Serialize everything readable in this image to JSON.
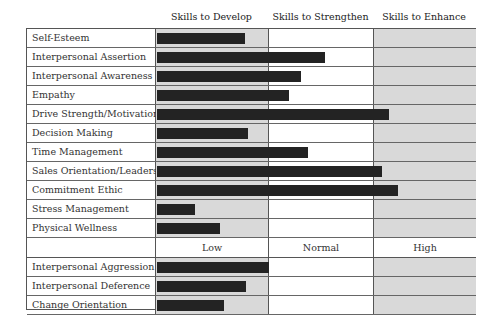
{
  "chart_data": {
    "type": "bar",
    "orientation": "horizontal",
    "title": "",
    "sections": [
      {
        "column_headers": [
          "Skills to Develop",
          "Skills to Strengthen",
          "Skills to Enhance"
        ],
        "categories": [
          "Self-Esteem",
          "Interpersonal Assertion",
          "Interpersonal Awareness",
          "Empathy",
          "Drive Strength/Motivation",
          "Decision Making",
          "Time Management",
          "Sales Orientation/Leadership",
          "Commitment Ethic",
          "Stress Management",
          "Physical Wellness"
        ],
        "values": [
          28,
          53,
          45,
          41,
          73,
          29,
          47,
          71,
          76,
          12,
          20
        ]
      },
      {
        "column_headers": [
          "Low",
          "Normal",
          "High"
        ],
        "categories": [
          "Interpersonal Aggression",
          "Interpersonal Deference",
          "Change Orientation"
        ],
        "values": [
          35,
          28,
          21
        ]
      }
    ],
    "xlim": [
      0,
      100
    ],
    "zone_bounds": [
      0,
      35.7,
      68.8,
      100
    ],
    "grid": false,
    "legend": "none",
    "colors": {
      "bar": "#232323",
      "shaded_zone": "#d9d9d9",
      "plain_zone": "#ffffff"
    }
  },
  "headers": {
    "develop": "Skills to Develop",
    "strengthen": "Skills to Strengthen",
    "enhance": "Skills to Enhance"
  },
  "subheaders": {
    "low": "Low",
    "normal": "Normal",
    "high": "High"
  },
  "rows_top": [
    {
      "label": "Self-Esteem",
      "bar_px": 88
    },
    {
      "label": "Interpersonal Assertion",
      "bar_px": 168
    },
    {
      "label": "Interpersonal Awareness",
      "bar_px": 144
    },
    {
      "label": "Empathy",
      "bar_px": 132
    },
    {
      "label": "Drive Strength/Motivation",
      "bar_px": 232
    },
    {
      "label": "Decision Making",
      "bar_px": 91
    },
    {
      "label": "Time Management",
      "bar_px": 151
    },
    {
      "label": "Sales Orientation/Leadership",
      "bar_px": 225
    },
    {
      "label": "Commitment Ethic",
      "bar_px": 241
    },
    {
      "label": "Stress Management",
      "bar_px": 38
    },
    {
      "label": "Physical Wellness",
      "bar_px": 63
    }
  ],
  "rows_bottom": [
    {
      "label": "Interpersonal Aggression",
      "bar_px": 112
    },
    {
      "label": "Interpersonal Deference",
      "bar_px": 89
    },
    {
      "label": "Change Orientation",
      "bar_px": 67
    }
  ]
}
